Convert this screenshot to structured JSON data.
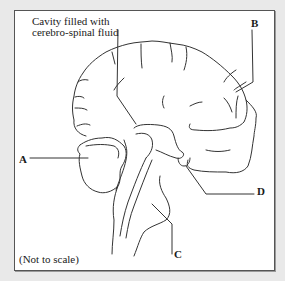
{
  "diagram": {
    "cavity_label_line1": "Cavity filled with",
    "cavity_label_line2": "cerebro-spinal fluid",
    "labels": {
      "A": "A",
      "B": "B",
      "C": "C",
      "D": "D"
    },
    "note": "(Not to scale)"
  },
  "colors": {
    "background": "#e9e9e9",
    "panel": "#ffffff",
    "line": "#333333",
    "border": "#555555"
  }
}
